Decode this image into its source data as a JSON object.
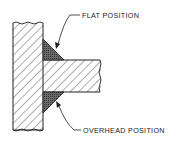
{
  "diagram": {
    "type": "weld-joint-cross-section",
    "labels": {
      "flat": "FLAT POSITION",
      "overhead": "OVERHEAD POSITION"
    },
    "colors": {
      "line": "#222222",
      "weld_fill": "#5a5a5a",
      "hatch": "#333333",
      "background": "#ffffff"
    },
    "parts": [
      {
        "name": "vertical-plate",
        "description": "hatched vertical base plate"
      },
      {
        "name": "horizontal-plate",
        "description": "hatched horizontal plate with break line"
      },
      {
        "name": "upper-weld",
        "description": "fillet weld made in flat position"
      },
      {
        "name": "lower-weld",
        "description": "fillet weld made in overhead position"
      }
    ]
  }
}
